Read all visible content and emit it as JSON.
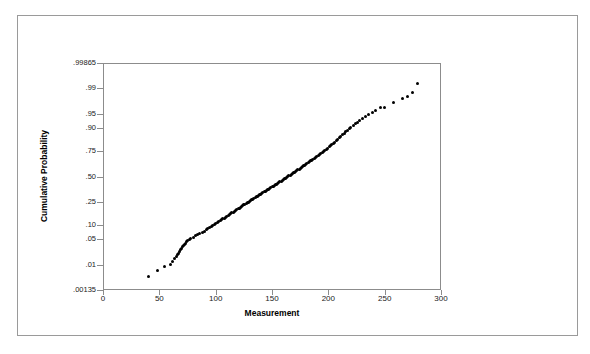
{
  "chart_data": {
    "type": "scatter",
    "title": "",
    "xlabel": "Measurement",
    "ylabel": "Cumulative Probability",
    "grid": false,
    "legend": null,
    "y_scale": "normal-probability",
    "xlim": [
      0,
      300
    ],
    "xticks": [
      0,
      50,
      100,
      150,
      200,
      250,
      300
    ],
    "xtick_labels": [
      "0",
      "50",
      "100",
      "150",
      "200",
      "250",
      "300"
    ],
    "yticks": [
      0.00135,
      0.01,
      0.05,
      0.1,
      0.25,
      0.5,
      0.75,
      0.9,
      0.95,
      0.99,
      0.99865
    ],
    "ytick_labels": [
      ".00135",
      ".01",
      ".05",
      ".10",
      ".25",
      ".50",
      ".75",
      ".90",
      ".95",
      ".99",
      ".99865"
    ],
    "ylim": [
      0.00135,
      0.99865
    ],
    "marker_color": "#000000",
    "marker_size": 3,
    "points": [
      [
        40.0,
        0.004
      ],
      [
        48.5,
        0.0065
      ],
      [
        55.0,
        0.0085
      ],
      [
        60.0,
        0.01
      ],
      [
        62.0,
        0.0125
      ],
      [
        63.5,
        0.015
      ],
      [
        65.0,
        0.017
      ],
      [
        66.0,
        0.0195
      ],
      [
        67.0,
        0.0215
      ],
      [
        68.0,
        0.024
      ],
      [
        69.0,
        0.0265
      ],
      [
        70.0,
        0.029
      ],
      [
        70.8,
        0.0315
      ],
      [
        71.5,
        0.034
      ],
      [
        72.2,
        0.0365
      ],
      [
        73.0,
        0.039
      ],
      [
        74.0,
        0.042
      ],
      [
        75.0,
        0.045
      ],
      [
        76.5,
        0.048
      ],
      [
        78.0,
        0.0505
      ],
      [
        80.0,
        0.054
      ],
      [
        82.0,
        0.058
      ],
      [
        84.0,
        0.062
      ],
      [
        86.0,
        0.066
      ],
      [
        88.0,
        0.07
      ],
      [
        90.0,
        0.0745
      ],
      [
        91.5,
        0.079
      ],
      [
        93.0,
        0.083
      ],
      [
        94.5,
        0.0875
      ],
      [
        96.0,
        0.092
      ],
      [
        97.5,
        0.0965
      ],
      [
        99.0,
        0.101
      ],
      [
        100.2,
        0.106
      ],
      [
        101.5,
        0.111
      ],
      [
        102.8,
        0.116
      ],
      [
        104.0,
        0.121
      ],
      [
        105.2,
        0.126
      ],
      [
        106.4,
        0.131
      ],
      [
        107.6,
        0.136
      ],
      [
        108.8,
        0.141
      ],
      [
        110.0,
        0.1465
      ],
      [
        111.1,
        0.152
      ],
      [
        112.2,
        0.1575
      ],
      [
        113.3,
        0.163
      ],
      [
        114.4,
        0.1685
      ],
      [
        115.5,
        0.174
      ],
      [
        116.6,
        0.1795
      ],
      [
        117.7,
        0.185
      ],
      [
        118.8,
        0.1905
      ],
      [
        119.9,
        0.196
      ],
      [
        121.0,
        0.202
      ],
      [
        122.0,
        0.208
      ],
      [
        123.0,
        0.214
      ],
      [
        124.0,
        0.22
      ],
      [
        125.0,
        0.226
      ],
      [
        126.0,
        0.232
      ],
      [
        127.0,
        0.238
      ],
      [
        128.0,
        0.244
      ],
      [
        129.0,
        0.25
      ],
      [
        130.0,
        0.256
      ],
      [
        131.0,
        0.2625
      ],
      [
        132.0,
        0.269
      ],
      [
        133.0,
        0.2755
      ],
      [
        134.0,
        0.282
      ],
      [
        135.0,
        0.2885
      ],
      [
        136.0,
        0.295
      ],
      [
        137.0,
        0.3015
      ],
      [
        138.0,
        0.308
      ],
      [
        139.0,
        0.3145
      ],
      [
        140.0,
        0.321
      ],
      [
        141.0,
        0.328
      ],
      [
        142.0,
        0.335
      ],
      [
        143.0,
        0.342
      ],
      [
        144.0,
        0.349
      ],
      [
        145.0,
        0.356
      ],
      [
        146.0,
        0.363
      ],
      [
        147.0,
        0.37
      ],
      [
        148.0,
        0.377
      ],
      [
        149.0,
        0.384
      ],
      [
        150.0,
        0.391
      ],
      [
        151.0,
        0.3985
      ],
      [
        152.0,
        0.406
      ],
      [
        153.0,
        0.4135
      ],
      [
        154.0,
        0.421
      ],
      [
        155.0,
        0.4285
      ],
      [
        156.0,
        0.436
      ],
      [
        157.0,
        0.4435
      ],
      [
        158.0,
        0.451
      ],
      [
        159.0,
        0.4585
      ],
      [
        160.0,
        0.466
      ],
      [
        161.0,
        0.474
      ],
      [
        162.0,
        0.482
      ],
      [
        163.0,
        0.49
      ],
      [
        164.0,
        0.498
      ],
      [
        165.0,
        0.506
      ],
      [
        166.0,
        0.514
      ],
      [
        167.0,
        0.522
      ],
      [
        168.0,
        0.53
      ],
      [
        169.0,
        0.538
      ],
      [
        170.0,
        0.546
      ],
      [
        171.0,
        0.554
      ],
      [
        172.0,
        0.562
      ],
      [
        173.0,
        0.57
      ],
      [
        174.0,
        0.578
      ],
      [
        175.0,
        0.586
      ],
      [
        176.0,
        0.594
      ],
      [
        177.0,
        0.602
      ],
      [
        178.0,
        0.61
      ],
      [
        179.0,
        0.618
      ],
      [
        180.0,
        0.626
      ],
      [
        181.0,
        0.6345
      ],
      [
        182.0,
        0.643
      ],
      [
        183.0,
        0.6515
      ],
      [
        184.0,
        0.66
      ],
      [
        185.0,
        0.6685
      ],
      [
        186.2,
        0.677
      ],
      [
        187.4,
        0.6855
      ],
      [
        188.6,
        0.694
      ],
      [
        189.8,
        0.7025
      ],
      [
        191.0,
        0.711
      ],
      [
        192.2,
        0.72
      ],
      [
        193.4,
        0.729
      ],
      [
        194.6,
        0.738
      ],
      [
        195.8,
        0.747
      ],
      [
        197.0,
        0.756
      ],
      [
        198.2,
        0.765
      ],
      [
        199.4,
        0.774
      ],
      [
        200.6,
        0.783
      ],
      [
        201.8,
        0.792
      ],
      [
        203.0,
        0.801
      ],
      [
        204.3,
        0.81
      ],
      [
        205.6,
        0.819
      ],
      [
        206.9,
        0.828
      ],
      [
        208.2,
        0.837
      ],
      [
        209.5,
        0.846
      ],
      [
        211.0,
        0.855
      ],
      [
        212.5,
        0.864
      ],
      [
        214.0,
        0.873
      ],
      [
        215.5,
        0.881
      ],
      [
        217.0,
        0.889
      ],
      [
        218.5,
        0.8965
      ],
      [
        220.0,
        0.904
      ],
      [
        222.0,
        0.911
      ],
      [
        224.0,
        0.918
      ],
      [
        226.0,
        0.9245
      ],
      [
        228.0,
        0.931
      ],
      [
        230.5,
        0.937
      ],
      [
        233.0,
        0.943
      ],
      [
        236.0,
        0.949
      ],
      [
        239.0,
        0.9545
      ],
      [
        242.0,
        0.96
      ],
      [
        246.0,
        0.965
      ],
      [
        250.0,
        0.966
      ],
      [
        258.0,
        0.974
      ],
      [
        266.0,
        0.98
      ],
      [
        270.0,
        0.983
      ],
      [
        274.5,
        0.987
      ],
      [
        279.0,
        0.993
      ]
    ]
  }
}
